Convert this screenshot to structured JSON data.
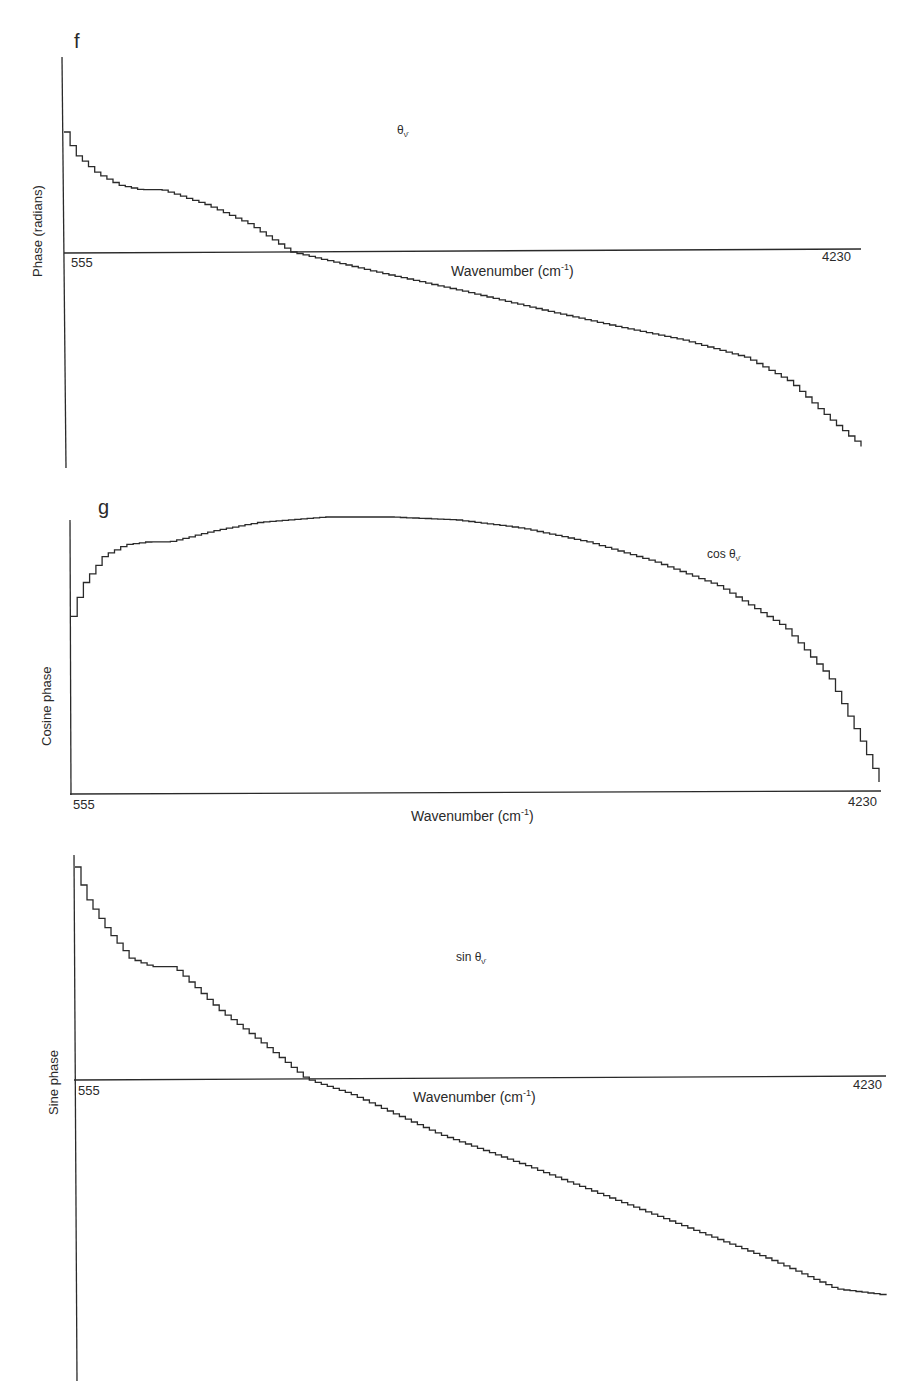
{
  "chart_data": [
    {
      "panel": "f",
      "type": "line",
      "step": true,
      "title": "",
      "series_label": "θ_ν̄",
      "series": [
        {
          "name": "θ_ν̄",
          "x": [
            555,
            600,
            700,
            800,
            900,
            1000,
            1200,
            1400,
            1600,
            2000,
            2400,
            2800,
            3100,
            3400,
            3700,
            3900,
            4100,
            4230
          ],
          "y": [
            1.0,
            0.82,
            0.66,
            0.56,
            0.52,
            0.52,
            0.4,
            0.24,
            0.0,
            -0.17,
            -0.33,
            -0.5,
            -0.62,
            -0.73,
            -0.88,
            -1.08,
            -1.42,
            -1.62
          ]
        }
      ],
      "xlabel": "Wavenumber (cm-1)",
      "ylabel": "Phase (radians)",
      "xticks": [
        "555",
        "4230"
      ],
      "xlim": [
        555,
        4230
      ],
      "ylim_relative": "zero-centered, no numeric ticks",
      "grid": false,
      "legend": "inline annotation"
    },
    {
      "panel": "g",
      "type": "line",
      "step": true,
      "series_label": "cos θ_ν̄",
      "series": [
        {
          "name": "cos θ_ν̄",
          "x": [
            555,
            600,
            700,
            800,
            900,
            1000,
            1200,
            1400,
            1700,
            2000,
            2300,
            2600,
            2900,
            3200,
            3500,
            3800,
            4000,
            4150,
            4230
          ],
          "y": [
            0.64,
            0.75,
            0.86,
            0.9,
            0.91,
            0.91,
            0.95,
            0.98,
            1.0,
            1.0,
            0.99,
            0.96,
            0.91,
            0.84,
            0.75,
            0.6,
            0.42,
            0.18,
            0.04
          ]
        }
      ],
      "xlabel": "Wavenumber (cm-1)",
      "ylabel": "Cosine phase",
      "xticks": [
        "555",
        "4230"
      ],
      "xlim": [
        555,
        4230
      ],
      "grid": false
    },
    {
      "panel": "h",
      "type": "line",
      "step": true,
      "series_label": "sin θ_ν̄",
      "series": [
        {
          "name": "sin θ_ν̄",
          "x": [
            555,
            600,
            700,
            800,
            900,
            1000,
            1200,
            1400,
            1600,
            1800,
            2200,
            2600,
            3000,
            3400,
            3700,
            4000,
            4230
          ],
          "y": [
            1.0,
            0.86,
            0.7,
            0.57,
            0.53,
            0.53,
            0.33,
            0.17,
            0.0,
            -0.07,
            -0.26,
            -0.41,
            -0.57,
            -0.73,
            -0.85,
            -0.99,
            -1.02
          ]
        }
      ],
      "xlabel": "Wavenumber (cm-1)",
      "ylabel": "Sine phase",
      "xticks": [
        "555",
        "4230"
      ],
      "xlim": [
        555,
        4230
      ],
      "grid": false
    }
  ],
  "panels": {
    "f": {
      "letter": "f",
      "series_main": "θ",
      "series_sub": "ν̄",
      "x_start": "555",
      "x_end": "4230",
      "xlabel_main": "Wavenumber (cm",
      "xlabel_sup": "-1",
      "xlabel_close": ")",
      "ylabel": "Phase (radians)"
    },
    "g": {
      "letter": "g",
      "series_main": "cos θ",
      "series_sub": "ν̄",
      "x_start": "555",
      "x_end": "4230",
      "xlabel_main": "Wavenumber (cm",
      "xlabel_sup": "-1",
      "xlabel_close": ")",
      "ylabel": "Cosine phase"
    },
    "h": {
      "series_main": "sin θ",
      "series_sub": "ν̄",
      "x_start": "555",
      "x_end": "4230",
      "xlabel_main": "Wavenumber (cm",
      "xlabel_sup": "-1",
      "xlabel_close": ")",
      "ylabel": "Sine phase"
    }
  },
  "colors": {
    "ink": "#2a2a2a",
    "background": "#ffffff"
  }
}
